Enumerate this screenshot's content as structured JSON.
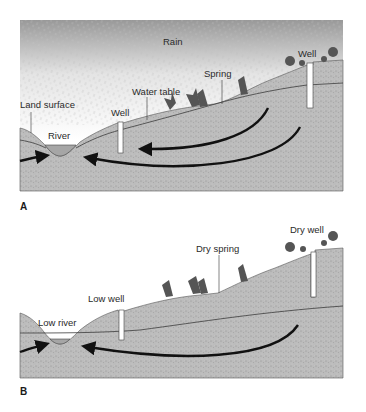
{
  "figure": {
    "panels": [
      {
        "id": "A",
        "letter": "A",
        "labels": {
          "rain": "Rain",
          "land_surface": "Land surface",
          "river": "River",
          "well_low": "Well",
          "water_table": "Water table",
          "spring": "Spring",
          "well_high": "Well"
        }
      },
      {
        "id": "B",
        "letter": "B",
        "labels": {
          "low_river": "Low river",
          "low_well": "Low well",
          "dry_spring": "Dry spring",
          "dry_well": "Dry well"
        }
      }
    ],
    "colors": {
      "ground": "#b9b9b9",
      "ground_dark": "#9d9d9d",
      "sky_top": "#9a9a9a",
      "sky_bottom": "#ffffff",
      "river_water": "#a9a9a9",
      "arrow": "#111111",
      "tree": "#555555",
      "line": "#444444"
    }
  }
}
